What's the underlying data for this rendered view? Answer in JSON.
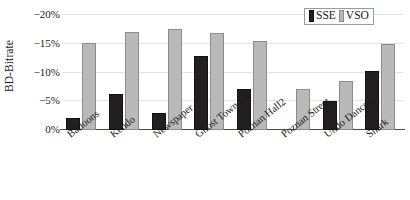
{
  "chart_data": {
    "type": "bar",
    "title": "",
    "xlabel": "",
    "ylabel": "BD-Bitrate",
    "ylim": [
      0,
      -20
    ],
    "grid": true,
    "legend_position": "top-right",
    "yticks": [
      "0%",
      "−5%",
      "−10%",
      "−15%",
      "−20%"
    ],
    "ytick_values": [
      0,
      -5,
      -10,
      -15,
      -20
    ],
    "categories": [
      "Balloons",
      "Kendo",
      "Newspaper",
      "Ghost Town Fly",
      "Poznan Hall2",
      "Poznan Street",
      "Undo Dancer",
      "Shark"
    ],
    "series": [
      {
        "name": "SSE",
        "color": "#231f20",
        "values": [
          -2.1,
          -6.2,
          -3.0,
          -12.9,
          -7.1,
          0.0,
          -5.1,
          -10.3
        ]
      },
      {
        "name": "VSO",
        "color": "#b9b9b9",
        "values": [
          -15.2,
          -17.1,
          -17.6,
          -16.9,
          -15.5,
          -7.1,
          -8.6,
          -15.0
        ]
      }
    ]
  },
  "legend": {
    "entries": [
      {
        "label": "SSE",
        "swatch": "sse"
      },
      {
        "label": "VSO",
        "swatch": "vso"
      }
    ]
  }
}
